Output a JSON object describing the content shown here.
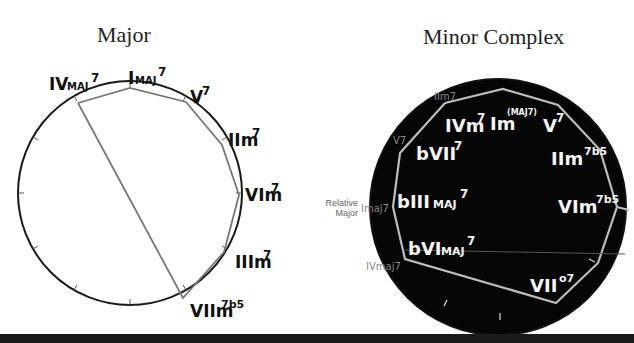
{
  "diagrams": [
    {
      "title": "Major",
      "style": "white-fill",
      "labels": [
        {
          "text": "IVmaj7",
          "root": "IV",
          "sub": "MAJ",
          "sup": "7"
        },
        {
          "text": "Imaj7",
          "root": "I",
          "sub": "MAJ",
          "sup": "7"
        },
        {
          "text": "V7",
          "root": "V",
          "sup": "7"
        },
        {
          "text": "IIm7",
          "root": "IIm",
          "sup": "7"
        },
        {
          "text": "VIm7",
          "root": "VIm",
          "sup": "7"
        },
        {
          "text": "IIIm7",
          "root": "IIIm",
          "sup": "7"
        },
        {
          "text": "VIIm7b5",
          "root": "VIIm",
          "sup": "7b5"
        }
      ]
    },
    {
      "title": "Minor Complex",
      "style": "black-fill",
      "inner_labels": [
        {
          "text": "IVm7",
          "root": "IVm",
          "sup": "7"
        },
        {
          "text": "Im(maj7)",
          "root": "Im",
          "sup": "(MAJ7)"
        },
        {
          "text": "V7",
          "root": "V",
          "sup": "7"
        },
        {
          "text": "bVII7",
          "root": "bVII",
          "sup": "7"
        },
        {
          "text": "IIm7b5",
          "root": "IIm",
          "sup": "7b5"
        },
        {
          "text": "bIIImaj7",
          "root": "bIII",
          "sub": "MAJ",
          "sup": "7"
        },
        {
          "text": "VIm7b5",
          "root": "VIm",
          "sup": "7b5"
        },
        {
          "text": "bVImaj7",
          "root": "bVI",
          "sub": "MAJ",
          "sup": "7"
        },
        {
          "text": "VII°7",
          "root": "VII",
          "sup": "o7"
        }
      ],
      "outer_labels": [
        {
          "text": "IIm7"
        },
        {
          "text": "V7"
        },
        {
          "text": "Imaj7"
        },
        {
          "text": "IVmaj7"
        }
      ],
      "annotation": {
        "line1": "Relative",
        "line2": "Major"
      }
    }
  ]
}
